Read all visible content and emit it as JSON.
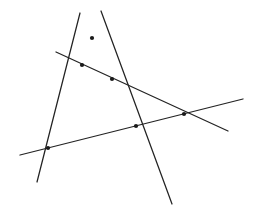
{
  "figure": {
    "width": 254,
    "height": 215,
    "background_color": "#ffffff",
    "line_color": "#232323",
    "node_color": "#1a1a1a",
    "line_width": 1.25,
    "node_radius": 2.1
  },
  "chart_data": {
    "type": "scatter",
    "subtitle": "",
    "xlabel": "",
    "ylabel": "",
    "xlim": [
      0,
      254
    ],
    "ylim": [
      0,
      215
    ],
    "grid": false,
    "legend": "none",
    "axes_visible": false,
    "tick_labels_x": [],
    "tick_labels_y": [],
    "annotations": [],
    "note": "Coordinates are in image pixel space, y increasing downward.",
    "series": [
      {
        "name": "line-steep-left",
        "type": "line",
        "description": "Steep line descending to the lower left",
        "x": [
          80,
          37
        ],
        "y": [
          13,
          182
        ]
      },
      {
        "name": "line-steep-right",
        "type": "line",
        "description": "Steep line descending to the lower right",
        "x": [
          101,
          172
        ],
        "y": [
          11,
          204
        ]
      },
      {
        "name": "line-upper-transversal",
        "type": "line",
        "description": "Shallow line sloping gently down to the right",
        "x": [
          56,
          228
        ],
        "y": [
          52,
          131
        ]
      },
      {
        "name": "line-lower-transversal",
        "type": "line",
        "description": "Shallow line sloping gently up to the right",
        "x": [
          20,
          243
        ],
        "y": [
          155,
          99
        ]
      }
    ],
    "intersections": [
      {
        "label": "apex",
        "x": 92,
        "y": 38,
        "lines": [
          "line-steep-left",
          "line-steep-right"
        ]
      },
      {
        "label": "left-upper",
        "x": 82,
        "y": 65,
        "lines": [
          "line-steep-left",
          "line-upper-transversal"
        ]
      },
      {
        "label": "mid-upper",
        "x": 112,
        "y": 79,
        "lines": [
          "line-steep-right",
          "line-upper-transversal"
        ]
      },
      {
        "label": "mid-lower",
        "x": 136,
        "y": 126,
        "lines": [
          "line-steep-right",
          "line-lower-transversal"
        ]
      },
      {
        "label": "left-lower",
        "x": 48,
        "y": 148,
        "lines": [
          "line-steep-left",
          "line-lower-transversal"
        ]
      },
      {
        "label": "right",
        "x": 184,
        "y": 114,
        "lines": [
          "line-upper-transversal",
          "line-lower-transversal"
        ]
      }
    ]
  }
}
